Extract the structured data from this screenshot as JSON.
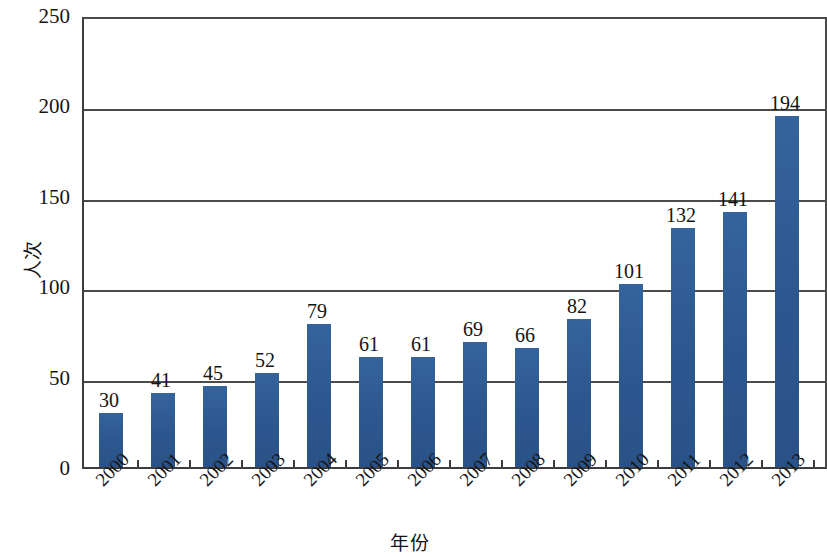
{
  "chart_data": {
    "type": "bar",
    "title": "",
    "xlabel": "年份",
    "ylabel": "人次",
    "categories": [
      "2000",
      "2001",
      "2002",
      "2003",
      "2004",
      "2005",
      "2006",
      "2007",
      "2008",
      "2009",
      "2010",
      "2011",
      "2012",
      "2013"
    ],
    "values": [
      30,
      41,
      45,
      52,
      79,
      61,
      61,
      69,
      66,
      82,
      101,
      132,
      141,
      194
    ],
    "value_labels": [
      "30",
      "41",
      "45",
      "52",
      "79",
      "61",
      "61",
      "69",
      "66",
      "82",
      "101",
      "132",
      "141",
      "194"
    ],
    "ylim": [
      0,
      250
    ],
    "ytick_labels": [
      "0",
      "50",
      "100",
      "150",
      "200",
      "250"
    ],
    "ytick_values": [
      0,
      50,
      100,
      150,
      200,
      250
    ],
    "grid": true,
    "grid_axis": "y",
    "legend": null,
    "legend_position": "none",
    "series": [
      {
        "name": "人次",
        "values": [
          30,
          41,
          45,
          52,
          79,
          61,
          61,
          69,
          66,
          82,
          101,
          132,
          141,
          194
        ]
      }
    ],
    "colors": {
      "bar": "#2e5c96",
      "axis": "#3d3d3d",
      "grid": "#4b4b4b",
      "text": "#151515",
      "background": "#ffffff"
    }
  }
}
